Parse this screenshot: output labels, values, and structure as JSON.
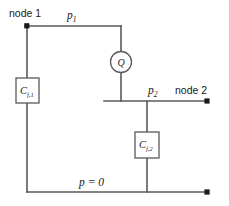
{
  "diagram": {
    "background_color": "#ffffff",
    "wire_color": "#5a5a5a",
    "text_color": "#1a1a1a",
    "labels": {
      "node1": "node 1",
      "node2": "node 2",
      "pressure1_symbol": "p",
      "pressure1_sub": "1",
      "pressure2_symbol": "p",
      "pressure2_sub": "2",
      "ground": "p = 0",
      "source_symbol": "Q",
      "capacitor1_symbol": "C",
      "capacitor1_sub": "f,1",
      "capacitor2_symbol": "C",
      "capacitor2_sub": "f,2"
    },
    "components": [
      {
        "id": "source-q",
        "type": "flow-source",
        "label": "Q",
        "shape": "circle",
        "cx": 121,
        "cy": 62,
        "r": 10.5
      },
      {
        "id": "capacitor-f1",
        "type": "fluid-capacitance",
        "label": "C f,1",
        "shape": "box",
        "x": 16,
        "y": 78,
        "width": 23,
        "height": 25
      },
      {
        "id": "capacitor-f2",
        "type": "fluid-capacitance",
        "label": "C f,2",
        "shape": "box",
        "x": 135,
        "y": 132,
        "width": 24,
        "height": 26
      }
    ],
    "nodes": [
      {
        "id": "node-1-terminal",
        "x": 27,
        "y": 26
      },
      {
        "id": "node-2-terminal",
        "x": 207,
        "y": 101
      },
      {
        "id": "ground-terminal",
        "x": 207,
        "y": 192
      }
    ],
    "wires": [
      {
        "id": "top-rail-node1-to-source",
        "path": "M 27 26 L 121 26"
      },
      {
        "id": "source-stub-top",
        "path": "M 121 26 L 121 51.5"
      },
      {
        "id": "source-stub-bottom",
        "path": "M 121 72.5 L 121 101"
      },
      {
        "id": "node1-branch-to-cap1",
        "path": "M 27 26 L 27 78"
      },
      {
        "id": "cap1-to-ground",
        "path": "M 27 103 L 27 192"
      },
      {
        "id": "ground-rail",
        "path": "M 27 192 L 207 192"
      },
      {
        "id": "node2-rail",
        "path": "M 104 101 L 207 101"
      },
      {
        "id": "cap2-branch-top",
        "path": "M 147 101 L 147 132"
      },
      {
        "id": "cap2-branch-bottom",
        "path": "M 147 158 L 147 192"
      }
    ]
  }
}
